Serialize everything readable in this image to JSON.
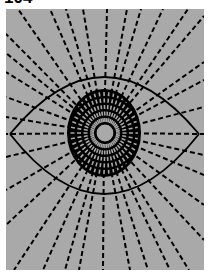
{
  "page_label": "104",
  "colors": {
    "background": "#a9a9a9",
    "ink": "#000000",
    "page": "#ffffff"
  },
  "panel": {
    "x": 6,
    "y": 9,
    "width": 198,
    "height": 261
  },
  "eye": {
    "left_corner": [
      10,
      134
    ],
    "right_corner": [
      199,
      134
    ],
    "upper_lid_peak": [
      104,
      77
    ],
    "lower_lid_bottom": [
      104,
      194
    ],
    "iris": {
      "cx": 104,
      "cy": 133,
      "rx": 37,
      "ry": 44
    },
    "pupil": {
      "cx": 105,
      "cy": 133,
      "r": 9
    },
    "iris_spoke_count": 44
  },
  "rays": {
    "origin": [
      104,
      133
    ],
    "endpoints": [
      [
        18,
        9
      ],
      [
        50,
        9
      ],
      [
        66,
        9
      ],
      [
        83,
        9
      ],
      [
        107,
        9
      ],
      [
        127,
        9
      ],
      [
        141,
        9
      ],
      [
        163,
        9
      ],
      [
        188,
        9
      ],
      [
        204,
        16
      ],
      [
        204,
        62
      ],
      [
        204,
        80
      ],
      [
        204,
        107
      ],
      [
        204,
        134
      ],
      [
        204,
        155
      ],
      [
        204,
        175
      ],
      [
        204,
        205
      ],
      [
        204,
        240
      ],
      [
        189,
        270
      ],
      [
        170,
        270
      ],
      [
        148,
        270
      ],
      [
        130,
        270
      ],
      [
        103,
        270
      ],
      [
        79,
        270
      ],
      [
        65,
        270
      ],
      [
        43,
        270
      ],
      [
        14,
        270
      ],
      [
        6,
        225
      ],
      [
        6,
        190
      ],
      [
        6,
        157
      ],
      [
        6,
        134
      ],
      [
        6,
        117
      ],
      [
        6,
        97
      ],
      [
        6,
        72
      ],
      [
        6,
        53
      ],
      [
        6,
        34
      ]
    ]
  }
}
